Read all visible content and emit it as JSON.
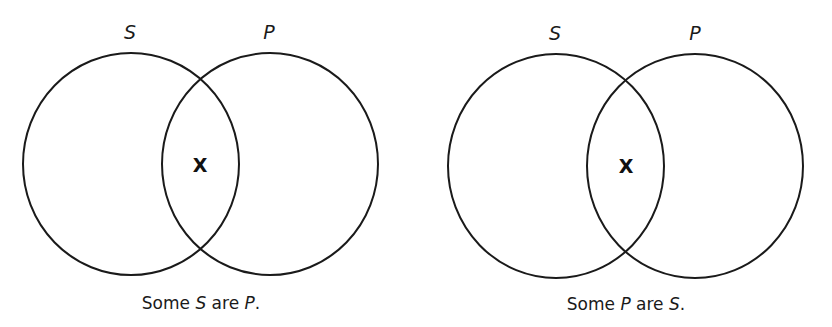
{
  "diagrams": [
    {
      "left_label": "S",
      "right_label": "P",
      "mark": "X",
      "caption": {
        "part1": "Some ",
        "term1": "S",
        "part2": " are ",
        "term2": "P",
        "part3": "."
      }
    },
    {
      "left_label": "S",
      "right_label": "P",
      "mark": "X",
      "caption": {
        "part1": "Some ",
        "term1": "P",
        "part2": " are ",
        "term2": "S",
        "part3": "."
      }
    }
  ],
  "colors": {
    "stroke": "#1a1a1a",
    "background": "#ffffff"
  }
}
